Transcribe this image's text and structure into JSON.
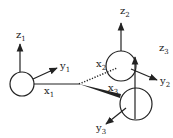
{
  "diagram": {
    "colors": {
      "stroke": "#222222",
      "background": "#ffffff"
    },
    "bodies": [
      {
        "id": "body-1",
        "cx": 22,
        "cy": 84,
        "r": 12
      },
      {
        "id": "body-2",
        "cx": 121,
        "cy": 66,
        "r": 15
      },
      {
        "id": "body-3",
        "cx": 136,
        "cy": 104,
        "r": 16
      }
    ],
    "labels": {
      "z1": {
        "base": "z",
        "sub": "1"
      },
      "y1": {
        "base": "y",
        "sub": "1"
      },
      "x1": {
        "base": "x",
        "sub": "1"
      },
      "z2": {
        "base": "z",
        "sub": "2"
      },
      "x2": {
        "base": "x",
        "sub": "2"
      },
      "y2": {
        "base": "y",
        "sub": "2"
      },
      "z3": {
        "base": "z",
        "sub": "3"
      },
      "x3": {
        "base": "x",
        "sub": "3"
      },
      "y3": {
        "base": "y",
        "sub": "3"
      }
    }
  }
}
